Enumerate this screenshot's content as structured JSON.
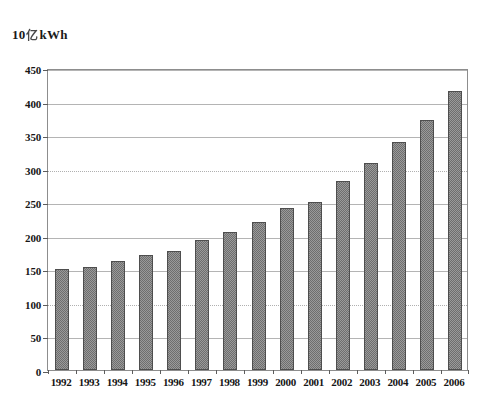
{
  "chart_data": {
    "type": "bar",
    "title_plain": "10 kWh",
    "title_prefix": "10",
    "title_exponent": "亿",
    "title_suffix": "kWh",
    "xlabel": "",
    "ylabel": "10亿 kWh",
    "categories": [
      "1992",
      "1993",
      "1994",
      "1995",
      "1996",
      "1997",
      "1998",
      "1999",
      "2000",
      "2001",
      "2002",
      "2003",
      "2004",
      "2005",
      "2006"
    ],
    "values": [
      150,
      154,
      162,
      171,
      178,
      193,
      206,
      220,
      241,
      251,
      282,
      308,
      340,
      373,
      416
    ],
    "ylim": [
      0,
      450
    ],
    "ytick_step": 50,
    "yticks": [
      0,
      50,
      100,
      150,
      200,
      250,
      300,
      350,
      400,
      450
    ],
    "ytick_labels": [
      "0",
      "50",
      "100",
      "150",
      "200",
      "250",
      "300",
      "350",
      "400",
      "450"
    ],
    "grid": true,
    "grid_axis": "y",
    "legend": false,
    "legend_position": "none",
    "series": [
      {
        "name": "Electricity consumption",
        "color": "#6e6e6e",
        "values": [
          150,
          154,
          162,
          171,
          178,
          193,
          206,
          220,
          241,
          251,
          282,
          308,
          340,
          373,
          416
        ]
      }
    ],
    "colors": {
      "bar_fill": "#6e6e6e",
      "bar_edge": "#4e4e4e",
      "gridline": "#b4b4b4",
      "frame": "#8d8d8d",
      "text": "#161616",
      "background": "#ffffff"
    }
  }
}
